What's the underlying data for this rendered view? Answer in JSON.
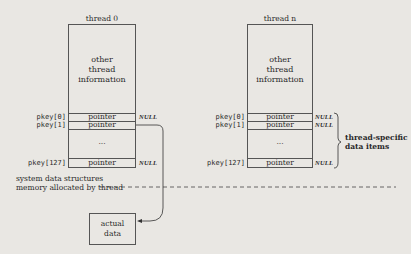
{
  "threads": [
    {
      "title": "thread 0",
      "info": [
        "other",
        "thread",
        "information"
      ],
      "keys": [
        {
          "key": "pkey[0]",
          "value": "pointer",
          "annotation": "NULL"
        },
        {
          "key": "pkey[1]",
          "value": "pointer",
          "annotation": ""
        },
        {
          "key": "",
          "value": "...",
          "annotation": ""
        },
        {
          "key": "pkey[127]",
          "value": "pointer",
          "annotation": "NULL"
        }
      ]
    },
    {
      "title": "thread n",
      "info": [
        "other",
        "thread",
        "information"
      ],
      "keys": [
        {
          "key": "pkey[0]",
          "value": "pointer",
          "annotation": "NULL"
        },
        {
          "key": "pkey[1]",
          "value": "pointer",
          "annotation": "NULL"
        },
        {
          "key": "",
          "value": "...",
          "annotation": ""
        },
        {
          "key": "pkey[127]",
          "value": "pointer",
          "annotation": "NULL"
        }
      ]
    }
  ],
  "brace_label": [
    "thread-specific",
    "data items"
  ],
  "divider": {
    "above": "system data structures",
    "below": "memory allocated by thread"
  },
  "actual_data": [
    "actual",
    "data"
  ],
  "colors": {
    "background": "#e9e7e3",
    "ink": "#2a2a2a"
  }
}
